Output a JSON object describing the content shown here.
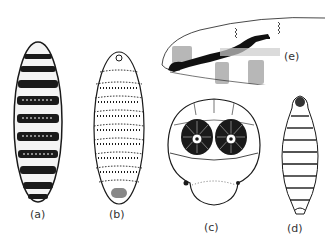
{
  "figure": {
    "panels": [
      {
        "id": "a",
        "label": "(a)",
        "description": "dark segmented larva, dorsal view"
      },
      {
        "id": "b",
        "label": "(b)",
        "description": "light stippled segmented larva, dorsal view"
      },
      {
        "id": "c",
        "label": "(c)",
        "description": "posterior end with two spiracular plates"
      },
      {
        "id": "d",
        "label": "(d)",
        "description": "tapered segmented larva"
      },
      {
        "id": "e",
        "label": "(e)",
        "description": "mouth hook / cephalopharyngeal skeleton, lateral view"
      }
    ]
  },
  "colors": {
    "ink": "#1a1a1a",
    "background": "#ffffff",
    "label": "#333333"
  }
}
